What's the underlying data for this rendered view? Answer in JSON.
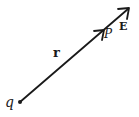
{
  "diagram": {
    "title": "",
    "colors": {
      "stroke": "#1a1a1a",
      "background": "#ffffff"
    },
    "labels": {
      "charge": "q",
      "position_vector": "r",
      "point": "P",
      "field": "E"
    },
    "elements": [
      {
        "id": "charge-q",
        "type": "point",
        "x": 20,
        "y": 102
      },
      {
        "id": "vector-r",
        "type": "arrow",
        "from": [
          20,
          102
        ],
        "to": [
          104,
          30
        ],
        "label": "r"
      },
      {
        "id": "vector-E",
        "type": "arrow",
        "from": [
          104,
          30
        ],
        "to": [
          129,
          8
        ],
        "label": "E"
      },
      {
        "id": "point-P",
        "type": "point-label",
        "x": 106,
        "y": 34,
        "label": "P"
      }
    ]
  }
}
